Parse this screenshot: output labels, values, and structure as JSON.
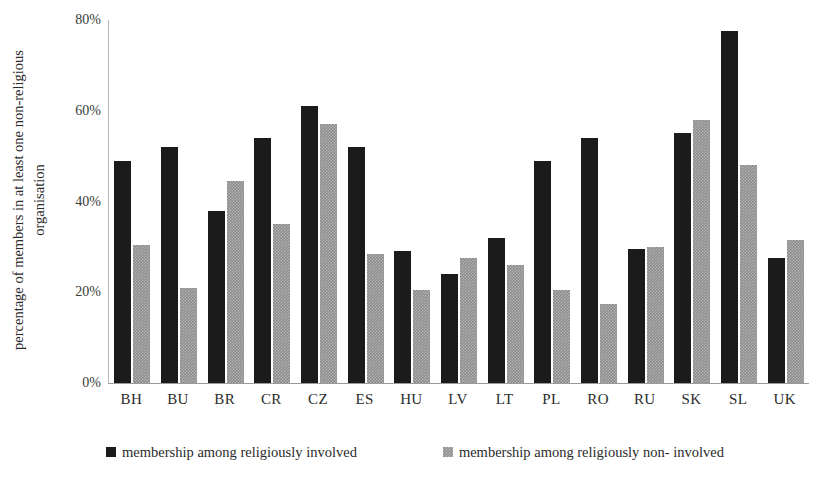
{
  "chart_data": {
    "type": "bar",
    "title": "",
    "xlabel": "",
    "ylabel_line1": "percentage of members in at least one non-religious",
    "ylabel_line2": "organisation",
    "ylim": [
      0,
      80
    ],
    "ytick_labels": [
      "80%",
      "60%",
      "40%",
      "20%",
      "0%"
    ],
    "ytick_values": [
      80,
      60,
      40,
      20,
      0
    ],
    "grid": false,
    "legend_position": "bottom",
    "categories": [
      "BH",
      "BU",
      "BR",
      "CR",
      "CZ",
      "ES",
      "HU",
      "LV",
      "LT",
      "PL",
      "RO",
      "RU",
      "SK",
      "SL",
      "UK"
    ],
    "series": [
      {
        "name": "membership among religiously involved",
        "color": "#1b1b1b",
        "values": [
          49,
          52,
          38,
          54,
          61,
          52,
          29,
          24,
          32,
          49,
          54,
          29.5,
          55,
          77.5,
          27.5
        ]
      },
      {
        "name": "membership among religiously non- involved",
        "color": "#8d8d8d",
        "values": [
          30.5,
          21,
          44.5,
          35,
          57,
          28.5,
          20.5,
          27.5,
          26,
          20.5,
          17.5,
          30,
          58,
          48,
          31.5
        ]
      }
    ]
  },
  "legend": {
    "items": [
      {
        "label": "membership among religiously involved",
        "swatch": "dark-square-icon"
      },
      {
        "label": "membership among religiously non- involved",
        "swatch": "hatched-square-icon"
      }
    ]
  }
}
